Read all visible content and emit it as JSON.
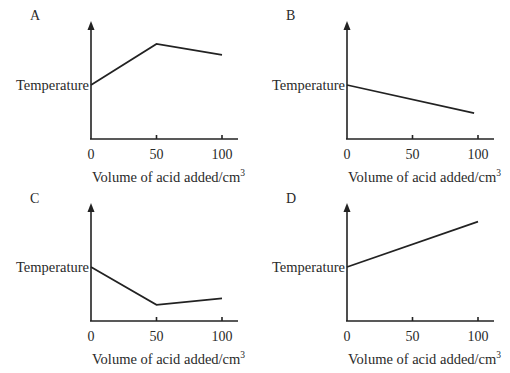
{
  "chart_data": [
    {
      "type": "line",
      "panel_label": "A",
      "ylabel": "Temperature",
      "xlabel": "Volume of acid added/cm",
      "xlabel_superscript": "3",
      "x_ticks": [
        "0",
        "50",
        "100"
      ],
      "xlim": [
        0,
        110
      ],
      "ylim": [
        0,
        10
      ],
      "x": [
        0,
        50,
        100
      ],
      "y": [
        5.0,
        8.8,
        7.8
      ]
    },
    {
      "type": "line",
      "panel_label": "B",
      "ylabel": "Temperature",
      "xlabel": "Volume of acid added/cm",
      "xlabel_superscript": "3",
      "x_ticks": [
        "0",
        "50",
        "100"
      ],
      "xlim": [
        0,
        110
      ],
      "ylim": [
        0,
        10
      ],
      "x": [
        0,
        97
      ],
      "y": [
        5.0,
        2.4
      ]
    },
    {
      "type": "line",
      "panel_label": "C",
      "ylabel": "Temperature",
      "xlabel": "Volume of acid added/cm",
      "xlabel_superscript": "3",
      "x_ticks": [
        "0",
        "50",
        "100"
      ],
      "xlim": [
        0,
        110
      ],
      "ylim": [
        0,
        10
      ],
      "x": [
        0,
        50,
        100
      ],
      "y": [
        5.0,
        1.5,
        2.1
      ]
    },
    {
      "type": "line",
      "panel_label": "D",
      "ylabel": "Temperature",
      "xlabel": "Volume of acid added/cm",
      "xlabel_superscript": "3",
      "x_ticks": [
        "0",
        "50",
        "100"
      ],
      "xlim": [
        0,
        110
      ],
      "ylim": [
        0,
        10
      ],
      "x": [
        0,
        100
      ],
      "y": [
        5.0,
        9.2
      ]
    }
  ]
}
